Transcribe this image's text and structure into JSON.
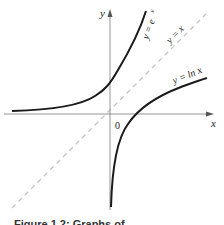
{
  "diagram": {
    "type": "function-graph",
    "axes": {
      "x_label": "x",
      "y_label": "y",
      "origin_label": "0"
    },
    "curves": [
      {
        "name": "exp",
        "label": "y = e^x",
        "label_display": "y = e",
        "label_sup": "x",
        "color": "#1a1a1a",
        "style": "solid"
      },
      {
        "name": "identity",
        "label": "y = x",
        "color": "#bbbbbb",
        "style": "dashed"
      },
      {
        "name": "log",
        "label": "y = ln x",
        "color": "#1a1a1a",
        "style": "solid"
      }
    ],
    "caption": "Figure 1.2: Graphs of ..."
  }
}
